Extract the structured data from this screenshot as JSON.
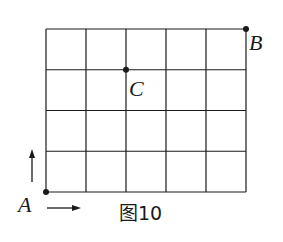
{
  "figure": {
    "caption": "图10",
    "grid": {
      "columns": 5,
      "rows": 4
    },
    "points": [
      {
        "id": "A",
        "label": "A",
        "col": 0,
        "row": 0
      },
      {
        "id": "C",
        "label": "C",
        "col": 2,
        "row": 3
      },
      {
        "id": "B",
        "label": "B",
        "col": 5,
        "row": 4
      }
    ],
    "arrows": [
      {
        "id": "up",
        "direction": "up"
      },
      {
        "id": "right",
        "direction": "right"
      }
    ],
    "line_color": "#1a1a1a"
  }
}
